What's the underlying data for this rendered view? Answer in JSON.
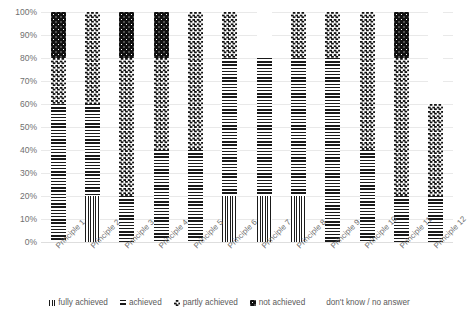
{
  "chart_data": {
    "type": "bar",
    "subtype": "stacked-bar-100-percent",
    "title": "",
    "xlabel": "",
    "ylabel": "",
    "ylim": [
      0,
      100
    ],
    "y_ticks": [
      "0%",
      "10%",
      "20%",
      "30%",
      "40%",
      "50%",
      "60%",
      "70%",
      "80%",
      "90%",
      "100%"
    ],
    "grid": true,
    "legend_position": "bottom",
    "categories": [
      "Principle 1",
      "Principle 2",
      "Principle 3",
      "Principle 4",
      "Principle 5",
      "Principle 6",
      "Principle 7",
      "Principle 8",
      "Principle 9",
      "Principle 10",
      "Principle 11",
      "Principle 12"
    ],
    "series": [
      {
        "name": "fully achieved",
        "pattern": "vertical-lines",
        "values": [
          0,
          20,
          0,
          0,
          0,
          20,
          20,
          20,
          0,
          0,
          0,
          0
        ]
      },
      {
        "name": "achieved",
        "pattern": "horizontal-lines",
        "values": [
          60,
          40,
          20,
          40,
          40,
          60,
          60,
          60,
          80,
          40,
          20,
          20
        ]
      },
      {
        "name": "partly achieved",
        "pattern": "checkerboard",
        "values": [
          20,
          40,
          60,
          40,
          60,
          20,
          0,
          20,
          20,
          60,
          60,
          40
        ]
      },
      {
        "name": "not achieved",
        "pattern": "dark-dotted",
        "values": [
          20,
          0,
          20,
          20,
          0,
          0,
          0,
          0,
          0,
          0,
          20,
          0
        ]
      },
      {
        "name": "don't know / no answer",
        "pattern": "light-dotted",
        "values": [
          0,
          0,
          0,
          0,
          0,
          0,
          20,
          0,
          0,
          0,
          0,
          40
        ]
      }
    ]
  },
  "legend": {
    "items": [
      {
        "label": "fully achieved",
        "pattern": "vertical-lines"
      },
      {
        "label": "achieved",
        "pattern": "horizontal-lines"
      },
      {
        "label": "partly achieved",
        "pattern": "checkerboard"
      },
      {
        "label": "not achieved",
        "pattern": "dark-dotted"
      },
      {
        "label": "don't know / no answer",
        "pattern": "light-dotted"
      }
    ]
  },
  "colors": {
    "ink": "#111111",
    "gridline": "#e9e9e9",
    "text": "#6f6f6f",
    "background": "#ffffff"
  }
}
